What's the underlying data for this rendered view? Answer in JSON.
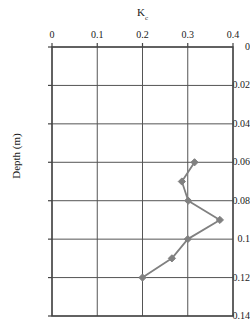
{
  "chart_data": {
    "type": "line",
    "title": "Kc",
    "title_base": "K",
    "title_subscript": "c",
    "xlabel": "Kc",
    "ylabel": "Depth (m)",
    "xlim": [
      0,
      0.4
    ],
    "ylim": [
      0,
      0.14
    ],
    "y_inverted": true,
    "grid": true,
    "legend": false,
    "xticks": [
      "0",
      "0.1",
      "0.2",
      "0.3",
      "0.4"
    ],
    "xtick_values": [
      0,
      0.1,
      0.2,
      0.3,
      0.4
    ],
    "yticks": [
      "0",
      "0.02",
      "0.04",
      "0.06",
      "0.08",
      "0.1",
      "0.12",
      "0.14"
    ],
    "ytick_values": [
      0,
      0.02,
      0.04,
      0.06,
      0.08,
      0.1,
      0.12,
      0.14
    ],
    "series": [
      {
        "name": "Kc profile",
        "marker": "diamond",
        "color": "#808080",
        "x": [
          0.315,
          0.287,
          0.301,
          0.371,
          0.3,
          0.265,
          0.2
        ],
        "y": [
          0.06,
          0.07,
          0.08,
          0.09,
          0.1,
          0.11,
          0.12
        ]
      }
    ],
    "colors": {
      "line": "#808080",
      "marker": "#808080",
      "grid": "#555555",
      "axis": "#444444",
      "background": "#ffffff",
      "text": "#1a1a1a"
    }
  }
}
